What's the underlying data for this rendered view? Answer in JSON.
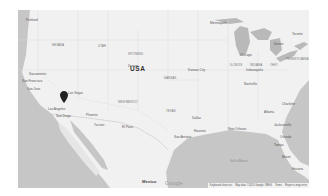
{
  "map": {
    "type": "roadmap",
    "style": "grayscale",
    "country_label": "USA",
    "neighbor_label": "Mexico",
    "logo": "Google",
    "marker": {
      "icon": "map-pin-icon",
      "color": "#222222",
      "near": "Los Angeles"
    },
    "colors": {
      "land": "#f1f1f1",
      "water": "#c6c6c6",
      "lakes": "#b9b9b9",
      "marker": "#222222"
    },
    "cities": [
      {
        "name": "Portland",
        "x": 8,
        "y": 9
      },
      {
        "name": "Sacramento",
        "x": 11,
        "y": 63
      },
      {
        "name": "San Francisco",
        "x": 4,
        "y": 70
      },
      {
        "name": "San Jose",
        "x": 9,
        "y": 78
      },
      {
        "name": "Las Vegas",
        "x": 50,
        "y": 82
      },
      {
        "name": "Los Angeles",
        "x": 30,
        "y": 98
      },
      {
        "name": "San Diego",
        "x": 38,
        "y": 105
      },
      {
        "name": "Phoenix",
        "x": 68,
        "y": 104
      },
      {
        "name": "Tucson",
        "x": 76,
        "y": 114
      },
      {
        "name": "El Paso",
        "x": 104,
        "y": 116
      },
      {
        "name": "Denver",
        "x": 110,
        "y": 55
      },
      {
        "name": "Minneapolis",
        "x": 192,
        "y": 12
      },
      {
        "name": "Chicago",
        "x": 228,
        "y": 40
      },
      {
        "name": "Detroit",
        "x": 256,
        "y": 33
      },
      {
        "name": "Toronto",
        "x": 280,
        "y": 23
      },
      {
        "name": "Kansas City",
        "x": 176,
        "y": 59
      },
      {
        "name": "Indianapolis",
        "x": 234,
        "y": 59
      },
      {
        "name": "Nashville",
        "x": 232,
        "y": 73
      },
      {
        "name": "Atlanta",
        "x": 250,
        "y": 101
      },
      {
        "name": "Charlotte",
        "x": 268,
        "y": 93
      },
      {
        "name": "Dallas",
        "x": 178,
        "y": 107
      },
      {
        "name": "Houston",
        "x": 178,
        "y": 122
      },
      {
        "name": "San Antonio",
        "x": 160,
        "y": 128
      },
      {
        "name": "New Orleans",
        "x": 214,
        "y": 122
      },
      {
        "name": "Jacksonville",
        "x": 270,
        "y": 117
      },
      {
        "name": "Orlando",
        "x": 272,
        "y": 128
      },
      {
        "name": "Tampa",
        "x": 266,
        "y": 136
      },
      {
        "name": "Miami",
        "x": 278,
        "y": 146
      },
      {
        "name": "Havana",
        "x": 282,
        "y": 156
      }
    ],
    "states": [
      {
        "name": "NEVADA",
        "x": 34,
        "y": 34
      },
      {
        "name": "UTAH",
        "x": 80,
        "y": 35
      },
      {
        "name": "WYOMING",
        "x": 110,
        "y": 43
      },
      {
        "name": "NEW MEXICO",
        "x": 105,
        "y": 91
      },
      {
        "name": "TEXAS",
        "x": 148,
        "y": 108
      },
      {
        "name": "ILLINOIS",
        "x": 220,
        "y": 55
      },
      {
        "name": "INDIANA",
        "x": 238,
        "y": 55
      },
      {
        "name": "OHIO",
        "x": 262,
        "y": 55
      },
      {
        "name": "KANSAS",
        "x": 150,
        "y": 67
      },
      {
        "name": "PENNSYLVANIA",
        "x": 286,
        "y": 50
      }
    ],
    "water_labels": [
      {
        "name": "Gulf of Mexico",
        "x": 218,
        "y": 146
      }
    ]
  },
  "attribution": {
    "keyboard": "Keyboard shortcuts",
    "data": "Map data ©2024 Google, INEGI",
    "terms": "Terms",
    "report": "Report a map error"
  }
}
